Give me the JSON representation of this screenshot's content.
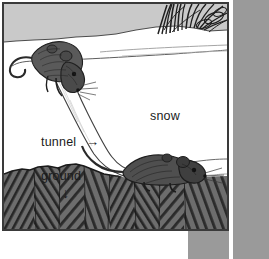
{
  "figure": {
    "labels": {
      "snow": "snow",
      "tunnel": "tunnel",
      "ground": "ground",
      "tunnel_arrow": "→",
      "ground_arrow": "↓"
    },
    "colors": {
      "sky": "#c9c9c9",
      "snow": "#ffffff",
      "ground": "#6d6d6d",
      "ground_hatch": "#2e2e2e",
      "mouse": "#555555",
      "mouse_dark": "#2b2b2b",
      "frame": "#3a3a3a",
      "outer_panel": "#9a9a9a",
      "text": "#1b1b1b",
      "contour": "#8c8c8c"
    },
    "elements": {
      "upper_mouse": "mouse entering tunnel at snow surface",
      "lower_mouse": "mouse on ground at tunnel bottom",
      "grass": "grass blades above snow at top right",
      "tunnel_shape": "diagonal white channel through snow"
    }
  }
}
